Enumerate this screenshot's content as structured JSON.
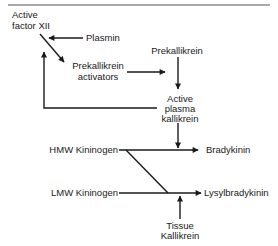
{
  "diagram": {
    "title": "",
    "nodes": {
      "active_factor_xii": {
        "line1": "Active",
        "line2": "factor XII"
      },
      "plasmin": {
        "label": "Plasmin"
      },
      "prekallikrein_activators": {
        "line1": "Prekallikrein",
        "line2": "activators"
      },
      "prekallikrein": {
        "label": "Prekallikrein"
      },
      "active_plasma_kallikrein": {
        "line1": "Active",
        "line2": "plasma",
        "line3": "kallikrein"
      },
      "hmw_kininogen": {
        "label": "HMW Kininogen"
      },
      "lmw_kininogen": {
        "label": "LMW Kininogen"
      },
      "bradykinin": {
        "label": "Bradykinin"
      },
      "lysylbradykinin": {
        "label": "Lysylbradykinin"
      },
      "tissue_kallikrein": {
        "line1": "Tissue",
        "line2": "Kallikrein"
      }
    },
    "edges": [
      {
        "from": "Plasmin",
        "to": "Active factor XII -> Prekallikrein activators conversion"
      },
      {
        "from": "Active factor XII",
        "to": "Prekallikrein activators"
      },
      {
        "from": "Prekallikrein activators",
        "to": "Prekallikrein -> Active plasma kallikrein conversion"
      },
      {
        "from": "Prekallikrein",
        "to": "Active plasma kallikrein"
      },
      {
        "from": "Active plasma kallikrein",
        "to": "Active factor XII",
        "type": "feedback"
      },
      {
        "from": "Active plasma kallikrein",
        "to": "HMW Kininogen -> Bradykinin conversion"
      },
      {
        "from": "HMW Kininogen",
        "to": "Bradykinin"
      },
      {
        "from": "HMW Kininogen",
        "to": "Lysylbradykinin"
      },
      {
        "from": "LMW Kininogen",
        "to": "Lysylbradykinin"
      },
      {
        "from": "Tissue Kallikrein",
        "to": "LMW Kininogen -> Lysylbradykinin conversion"
      }
    ],
    "colors": {
      "line": "#1a1a1a",
      "rule": "#555555",
      "background": "#ffffff"
    }
  }
}
